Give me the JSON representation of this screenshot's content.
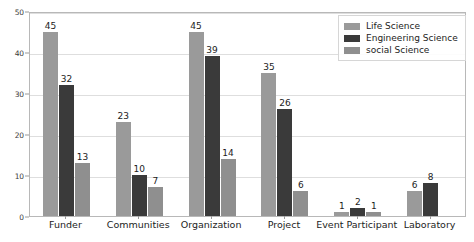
{
  "chart_data": {
    "type": "bar",
    "title": "",
    "xlabel": "",
    "ylabel": "",
    "ylim": [
      0,
      50
    ],
    "yticks": [
      0,
      10,
      20,
      30,
      40,
      50
    ],
    "grid": true,
    "legend_position": "top-right",
    "categories": [
      "Funder",
      "Communities",
      "Organization",
      "Project",
      "Event Participant",
      "Laboratory"
    ],
    "series": [
      {
        "name": "Life Science",
        "color": "#9a9a9a",
        "values": [
          45,
          23,
          45,
          35,
          1,
          6
        ]
      },
      {
        "name": "Engineering Science",
        "color": "#3a3a3a",
        "values": [
          32,
          10,
          39,
          26,
          2,
          8
        ]
      },
      {
        "name": "social Science",
        "color": "#8f8f8f",
        "values": [
          13,
          7,
          14,
          6,
          1,
          null
        ]
      }
    ]
  },
  "colors": {
    "life_science": "#9a9a9a",
    "engineering_science": "#3a3a3a",
    "social_science": "#8f8f8f",
    "gridline": "#dedede",
    "axis": "#b8b8b8",
    "text": "#1c1c1c",
    "background": "#ffffff"
  }
}
